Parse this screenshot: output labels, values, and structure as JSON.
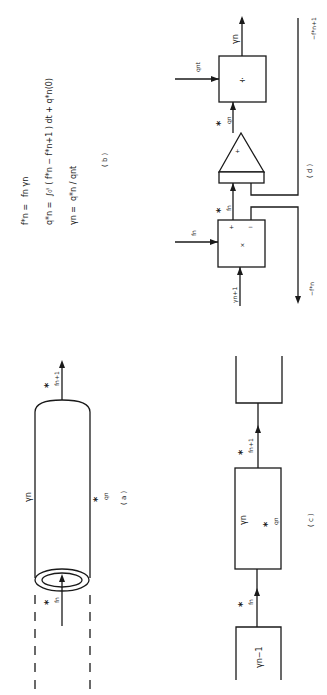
{
  "figure": {
    "orientation": "rotated-90-ccw",
    "panels": {
      "a": {
        "caption": "( a )",
        "element": "pipe-segment",
        "labels": {
          "resistance": "γn",
          "inflow_star": "*",
          "inflow_sub": "fn",
          "outflow_star": "*",
          "outflow_sub": "fn+1",
          "charge_star": "*",
          "charge_sub": "qn"
        }
      },
      "b": {
        "caption": "( b )",
        "equations": [
          {
            "lhs": "f*n =",
            "rhs": "fn  γn"
          },
          {
            "lhs": "q*n =",
            "rhs": "∫₀ᵗ ( f*n − f*n+1 ) dt + q*n(0)"
          },
          {
            "lhs": "γn =",
            "rhs": "q*n / qnt"
          }
        ]
      },
      "c": {
        "caption": "( c )",
        "blocks": [
          {
            "label": "γn−1"
          },
          {
            "label": "γn",
            "sublabel": "q*n"
          },
          {
            "label": ""
          }
        ],
        "arrows": [
          {
            "star": "*",
            "sub": "fn"
          },
          {
            "star": "*",
            "sub": "fn+1"
          }
        ]
      },
      "d": {
        "caption": "( d )",
        "multiplier": {
          "symbol": "×",
          "plus": "+",
          "minus": "−",
          "input_top": "fn",
          "input_bottom": "γn+1"
        },
        "integrator": {
          "symbol": "+"
        },
        "divider": {
          "symbol": "÷",
          "input": "qnt",
          "output": "γn"
        },
        "signals": {
          "mult_out_star": "*",
          "mult_out_sub": "fn",
          "int_out_star": "*",
          "int_out_sub": "qn",
          "feedback_out": "−f*n",
          "feedback_in": "−f*n+1"
        }
      }
    }
  }
}
